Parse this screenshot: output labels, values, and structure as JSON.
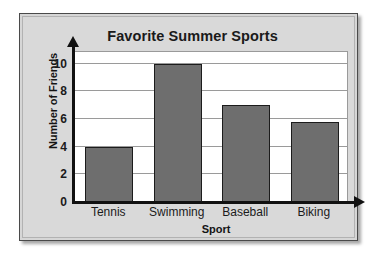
{
  "chart_data": {
    "type": "bar",
    "title": "Favorite Summer Sports",
    "xlabel": "Sport",
    "ylabel": "Number of Friends",
    "categories": [
      "Tennis",
      "Swimming",
      "Baseball",
      "Biking"
    ],
    "values": [
      4,
      10,
      7,
      5.8
    ],
    "ylim": [
      0,
      11
    ],
    "yticks": [
      0,
      2,
      4,
      6,
      8,
      10
    ],
    "gridlines": [
      2,
      4,
      6,
      8,
      10
    ],
    "grid": true,
    "legend": "none",
    "bar_color": "#6e6e6e",
    "bar_edge_color": "#1c1c1c",
    "plot_background": "#ffffff",
    "panel_background": "#d9d9d9",
    "axis_color": "#111111",
    "gridline_color": "#9a9a9a"
  }
}
